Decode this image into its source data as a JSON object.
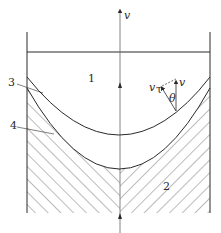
{
  "diagram": {
    "labels": {
      "region_liquid": "1",
      "region_solid": "2",
      "interface_upper": "3",
      "interface_lower": "4",
      "axis_velocity": "v",
      "local_velocity": "v",
      "tangential_velocity": "v",
      "tangential_subscript": "τ",
      "angle": "θ"
    },
    "colors": {
      "line": "#2a2a2a",
      "hatch": "#555555",
      "background": "#ffffff"
    }
  }
}
